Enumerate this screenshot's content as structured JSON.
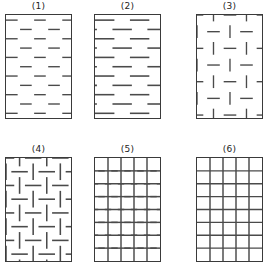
{
  "figure": {
    "title": "",
    "width": 267,
    "height": 273,
    "background": "#ffffff",
    "stroke_color": "#4a4a4a",
    "border_color": "#3a3a3a",
    "label_color": "#222222",
    "columns": 3,
    "rows": 2
  },
  "panels": [
    {
      "id": "panel-1",
      "label": "(1)",
      "pattern_type": "running-bond-horizontal-dashes-fine",
      "x": 5,
      "y": 14,
      "width": 67,
      "height": 105,
      "rows": 11,
      "dash_length": 12,
      "row_spacing": 9.5,
      "column_spacing": 29,
      "offset": 14.5,
      "orientation": "horizontal",
      "stroke_width": 1.4,
      "segments_vertical": false
    },
    {
      "id": "panel-2",
      "label": "(2)",
      "pattern_type": "running-bond-horizontal-dashes-coarse",
      "x": 94,
      "y": 14,
      "width": 67,
      "height": 105,
      "rows": 11,
      "dash_length": 20,
      "row_spacing": 9.5,
      "column_spacing": 36,
      "offset": 18,
      "orientation": "horizontal",
      "stroke_width": 1.6,
      "segments_vertical": false
    },
    {
      "id": "panel-3",
      "label": "(3)",
      "pattern_type": "basketweave-fine",
      "x": 196,
      "y": 14,
      "width": 67,
      "height": 105,
      "cell_size": 17,
      "dash_length": 13,
      "orientation": "mixed",
      "stroke_width": 1.4,
      "segments_vertical": true
    },
    {
      "id": "panel-4",
      "label": "(4)",
      "pattern_type": "basketweave-coarse",
      "x": 5,
      "y": 157,
      "width": 67,
      "height": 105,
      "cell_size": 14,
      "dash_length": 17,
      "orientation": "mixed",
      "stroke_width": 1.6,
      "segments_vertical": true
    },
    {
      "id": "panel-5",
      "label": "(5)",
      "pattern_type": "vertical-lines-with-staggered-horizontal-dashes",
      "x": 94,
      "y": 157,
      "width": 67,
      "height": 105,
      "columns": 5,
      "rows": 8,
      "dash_length": 20,
      "orientation": "mixed",
      "stroke_width": 1.5,
      "segments_vertical": true
    },
    {
      "id": "panel-6",
      "label": "(6)",
      "pattern_type": "stack-bond-full-grid",
      "x": 196,
      "y": 157,
      "width": 67,
      "height": 105,
      "columns": 5,
      "rows": 8,
      "orientation": "grid",
      "stroke_width": 1.5,
      "segments_vertical": true
    }
  ]
}
